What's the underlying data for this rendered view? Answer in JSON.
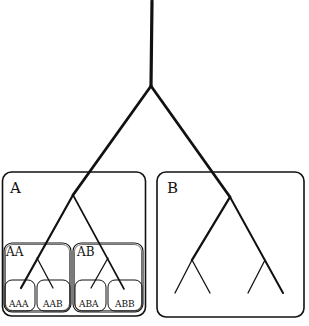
{
  "diagram": {
    "type": "nested-hierarchy-tree",
    "groups": [
      {
        "id": "A",
        "label": "A",
        "children": [
          {
            "id": "AA",
            "label": "AA",
            "children": [
              {
                "id": "AAA",
                "label": "AAA"
              },
              {
                "id": "AAB",
                "label": "AAB"
              }
            ]
          },
          {
            "id": "AB",
            "label": "AB",
            "children": [
              {
                "id": "ABA",
                "label": "ABA"
              },
              {
                "id": "ABB",
                "label": "ABB"
              }
            ]
          }
        ]
      },
      {
        "id": "B",
        "label": "B",
        "children": []
      }
    ],
    "labels": {
      "A": "A",
      "B": "B",
      "AA": "AA",
      "AB": "AB",
      "AAA": "AAA",
      "AAB": "AAB",
      "ABA": "ABA",
      "ABB": "ABB"
    },
    "colors": {
      "line": "#111111",
      "background": "#ffffff"
    }
  }
}
